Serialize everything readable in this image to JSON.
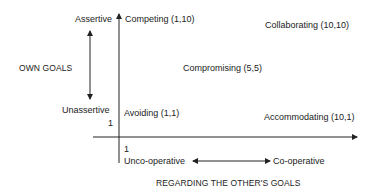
{
  "diagram": {
    "y_axis": {
      "title": "OWN GOALS",
      "high_label": "Assertive",
      "low_label": "Unassertive",
      "origin_tick": "1"
    },
    "x_axis": {
      "title": "REGARDING THE OTHER'S GOALS",
      "low_label": "Unco-operative",
      "high_label": "Co-operative",
      "origin_tick": "1"
    },
    "points": [
      {
        "label": "Competing (1,10)",
        "x": 1,
        "y": 10
      },
      {
        "label": "Collaborating (10,10)",
        "x": 10,
        "y": 10
      },
      {
        "label": "Compromising (5,5)",
        "x": 5,
        "y": 5
      },
      {
        "label": "Avoiding (1,1)",
        "x": 1,
        "y": 1
      },
      {
        "label": "Accommodating (10,1)",
        "x": 10,
        "y": 1
      }
    ],
    "colors": {
      "ink": "#222222",
      "background": "#ffffff"
    }
  }
}
